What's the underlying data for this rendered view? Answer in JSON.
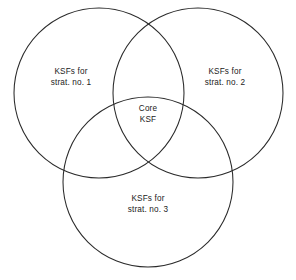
{
  "diagram": {
    "type": "venn-3-circle",
    "background_color": "#ffffff",
    "stroke_color": "#2a2a2a",
    "canvas": {
      "width": 296,
      "height": 280
    },
    "circles": [
      {
        "id": "set-1",
        "cx": 99,
        "cy": 93,
        "r": 85
      },
      {
        "id": "set-2",
        "cx": 198,
        "cy": 93,
        "r": 85
      },
      {
        "id": "set-3",
        "cx": 148,
        "cy": 182,
        "r": 85
      }
    ],
    "labels": {
      "set_1": {
        "line1": "KSFs for",
        "line2": "strat. no. 1"
      },
      "set_2": {
        "line1": "KSFs for",
        "line2": "strat. no. 2"
      },
      "set_3": {
        "line1": "KSFs for",
        "line2": "strat. no. 3"
      },
      "core": {
        "line1": "Core",
        "line2": "KSF"
      }
    }
  }
}
